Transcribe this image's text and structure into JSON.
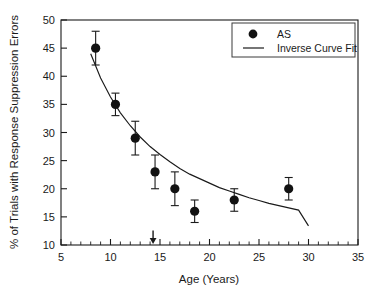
{
  "chart_data": {
    "type": "scatter",
    "title": "",
    "xlabel": "Age (Years)",
    "ylabel": "% of Trials with Response Suppression Errors",
    "xlim": [
      5,
      35
    ],
    "ylim": [
      10,
      50
    ],
    "x_ticks": [
      5,
      10,
      15,
      20,
      25,
      30,
      35
    ],
    "x_tick_labels": [
      "5",
      "10",
      "15",
      "20",
      "25",
      "30",
      "35"
    ],
    "x_minor_tick_step": 1,
    "y_ticks": [
      10,
      15,
      20,
      25,
      30,
      35,
      40,
      45,
      50
    ],
    "y_tick_labels": [
      "10",
      "15",
      "20",
      "25",
      "30",
      "35",
      "40",
      "45",
      "50"
    ],
    "grid": false,
    "legend_position": "top-right",
    "legend": [
      {
        "label": "AS",
        "marker": "filled-circle"
      },
      {
        "label": "Inverse Curve Fit",
        "marker": "line"
      }
    ],
    "series": [
      {
        "name": "AS",
        "marker": "filled-circle",
        "color": "#121212",
        "points": [
          {
            "x": 8.5,
            "y": 45,
            "yerr": 3
          },
          {
            "x": 10.5,
            "y": 35,
            "yerr": 2
          },
          {
            "x": 12.5,
            "y": 29,
            "yerr": 3
          },
          {
            "x": 14.5,
            "y": 23,
            "yerr": 3
          },
          {
            "x": 16.5,
            "y": 20,
            "yerr": 3
          },
          {
            "x": 18.5,
            "y": 16,
            "yerr": 2
          },
          {
            "x": 22.5,
            "y": 18,
            "yerr": 2
          },
          {
            "x": 28.0,
            "y": 20,
            "yerr": 2
          }
        ]
      },
      {
        "name": "Inverse Curve Fit",
        "type": "line",
        "color": "#1a1a1a",
        "x_range": [
          8,
          30
        ],
        "fit": {
          "form": "a + b/x",
          "a": 5.6,
          "b": 307
        },
        "points": [
          {
            "x": 8,
            "y": 44.0
          },
          {
            "x": 9,
            "y": 39.7
          },
          {
            "x": 10,
            "y": 36.3
          },
          {
            "x": 11,
            "y": 33.5
          },
          {
            "x": 12,
            "y": 31.2
          },
          {
            "x": 13,
            "y": 29.2
          },
          {
            "x": 14,
            "y": 27.5
          },
          {
            "x": 15,
            "y": 26.1
          },
          {
            "x": 16,
            "y": 24.8
          },
          {
            "x": 17,
            "y": 23.6
          },
          {
            "x": 18,
            "y": 22.6
          },
          {
            "x": 19,
            "y": 21.8
          },
          {
            "x": 20,
            "y": 21.0
          },
          {
            "x": 21,
            "y": 20.2
          },
          {
            "x": 22,
            "y": 19.6
          },
          {
            "x": 23,
            "y": 19.0
          },
          {
            "x": 24,
            "y": 18.4
          },
          {
            "x": 25,
            "y": 17.9
          },
          {
            "x": 26,
            "y": 17.4
          },
          {
            "x": 27,
            "y": 17.0
          },
          {
            "x": 28,
            "y": 16.6
          },
          {
            "x": 29,
            "y": 16.2
          },
          {
            "x": 30,
            "y": 13.4
          }
        ]
      }
    ],
    "annotations": [
      {
        "type": "arrow",
        "direction": "down",
        "x": 14.3,
        "y_from": 12.6,
        "y_to": 10.2,
        "label": ""
      }
    ]
  }
}
